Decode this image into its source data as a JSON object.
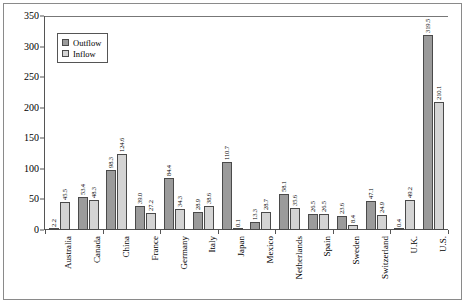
{
  "chart_data": {
    "type": "bar",
    "title": "",
    "xlabel": "",
    "ylabel": "",
    "ylim": [
      0,
      350
    ],
    "ytick_step": 50,
    "yticks": [
      "0",
      "50",
      "100",
      "150",
      "200",
      "250",
      "300",
      "350"
    ],
    "grid": false,
    "legend_position": "upper-left-inside",
    "categories": [
      "Australia",
      "Canada",
      "China",
      "France",
      "Germany",
      "Italy",
      "Japan",
      "Mexico",
      "Netherlands",
      "Spain",
      "Sweden",
      "Switzerland",
      "U.K.",
      "U.S."
    ],
    "series": [
      {
        "name": "Outflow",
        "color": "#9b9b9b",
        "values": [
          2.2,
          53.4,
          98.3,
          39.0,
          84.4,
          28.9,
          110.7,
          13.3,
          58.1,
          26.5,
          23.6,
          47.1,
          0.4,
          319.5
        ],
        "labels": [
          "2.2",
          "53.4",
          "98.3",
          "39.0",
          "84.4",
          "28.9",
          "110.7",
          "13.3",
          "58.1",
          "26.5",
          "23.6",
          "47.1",
          "0.4",
          "319.5"
        ]
      },
      {
        "name": "Inflow",
        "color": "#d4d4d4",
        "values": [
          45.5,
          48.3,
          124.6,
          27.2,
          34.3,
          38.6,
          0.1,
          28.7,
          35.6,
          26.5,
          8.4,
          24.9,
          49.2,
          210.1
        ],
        "labels": [
          "45.5",
          "48.3",
          "124.6",
          "27.2",
          "34.3",
          "38.6",
          "0.1",
          "28.7",
          "35.6",
          "26.5",
          "8.4",
          "24.9",
          "49.2",
          "210.1"
        ]
      }
    ]
  },
  "legend": {
    "items": [
      {
        "label": "Outflow"
      },
      {
        "label": "Inflow"
      }
    ]
  }
}
